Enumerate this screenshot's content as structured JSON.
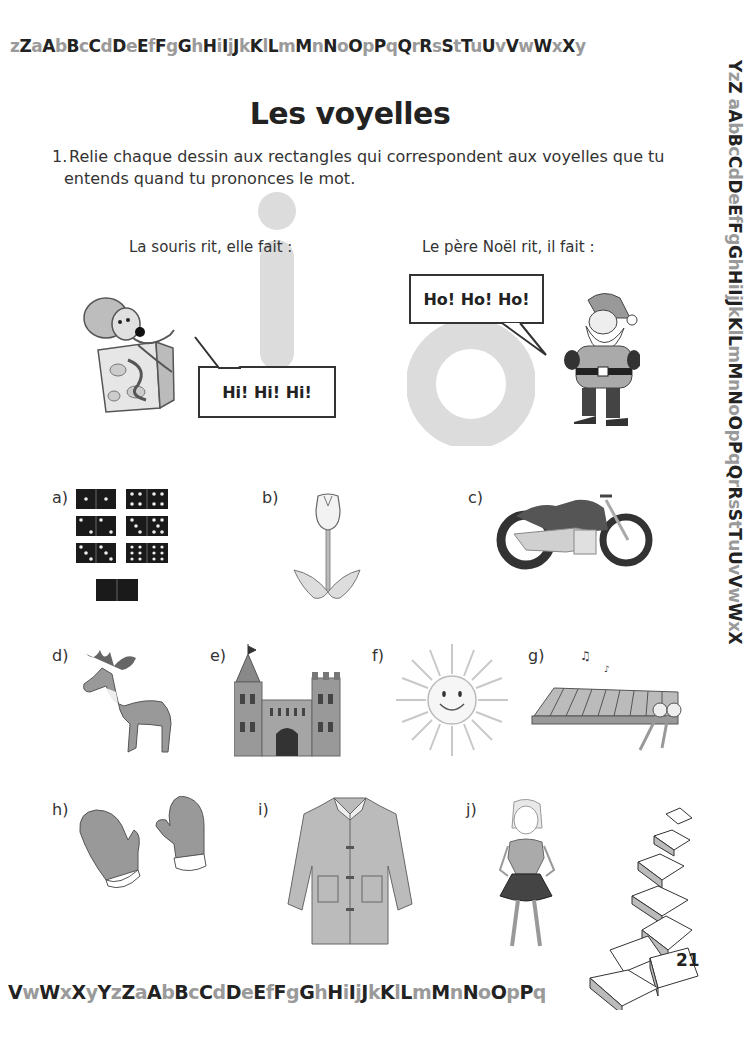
{
  "alphabet_strips": {
    "top": "zZaAbBcCdDeEfFgGhHiIjJkKlLmMnNoOpPqQrRsStTuUvVwWxXy",
    "right": "YzZ aAbBcCdDeEfFgGhHiIjJkKlLmMnNoOpPqQrRsStTuUvVwWxX",
    "bottom": "VwWxXyYzZaAbBcCdDeEfFgGhHiIjJkKlLmMnNoOpPq"
  },
  "colors": {
    "uppercase": "#222222",
    "lowercase": "#9a9a9a",
    "vowel_shape": "#dcdcdc",
    "ink": "#222222"
  },
  "title": "Les voyelles",
  "instruction": {
    "number": "1.",
    "line1": "Relie chaque dessin aux rectangles qui correspondent aux voyelles que tu",
    "line2": "entends quand tu prononces le mot."
  },
  "examples": [
    {
      "caption": "La souris rit, elle fait :",
      "bubble": "Hi! Hi! Hi!",
      "vowel": "i",
      "character": "mouse-on-cheese"
    },
    {
      "caption": "Le père Noël rit, il fait :",
      "bubble": "Ho! Ho! Ho!",
      "vowel": "o",
      "character": "santa-claus"
    }
  ],
  "items": [
    {
      "label": "a)",
      "picture": "dominoes"
    },
    {
      "label": "b)",
      "picture": "tulip"
    },
    {
      "label": "c)",
      "picture": "motorcycle"
    },
    {
      "label": "d)",
      "picture": "moose"
    },
    {
      "label": "e)",
      "picture": "castle"
    },
    {
      "label": "f)",
      "picture": "sun"
    },
    {
      "label": "g)",
      "picture": "xylophone"
    },
    {
      "label": "h)",
      "picture": "mittens"
    },
    {
      "label": "i)",
      "picture": "coat"
    },
    {
      "label": "j)",
      "picture": "girl"
    }
  ],
  "page_number": "21"
}
